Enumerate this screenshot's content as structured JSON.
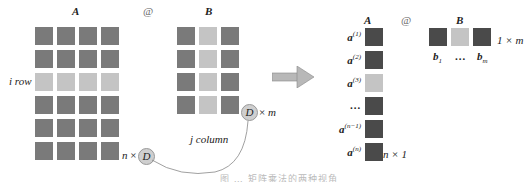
{
  "colors": {
    "dark": "#7a7a7a",
    "light": "#c4c4c4",
    "darker": "#4a4a4a",
    "circle": "#cfcfcf",
    "arrow": "#b8b8b8"
  },
  "left": {
    "matrix_a_label": "A",
    "at_symbol": "@",
    "matrix_b_label": "B",
    "row_label": "i row",
    "a_shape": {
      "n": "n",
      "times": "×",
      "d": "D"
    },
    "b_shape": {
      "d": "D",
      "times": "×",
      "m": "m"
    },
    "column_label": "j column",
    "a_grid": {
      "rows": 6,
      "cols": 4,
      "highlight_row": 2
    },
    "b_grid": {
      "rows": 4,
      "cols": 3,
      "highlight_col": 1
    }
  },
  "right": {
    "matrix_a_label": "A",
    "at_symbol": "@",
    "matrix_b_label": "B",
    "a_rows": [
      {
        "base": "a",
        "sup": "(1)",
        "highlight": false
      },
      {
        "base": "a",
        "sup": "(2)",
        "highlight": false
      },
      {
        "base": "a",
        "sup": "(3)",
        "highlight": true
      },
      {
        "base": "…",
        "sup": "",
        "highlight": false
      },
      {
        "base": "a",
        "sup": "(n−1)",
        "highlight": false
      },
      {
        "base": "a",
        "sup": "(n)",
        "highlight": false
      }
    ],
    "a_shape": "n × 1",
    "b_shape": "1 × m",
    "b_cols": [
      {
        "base": "b",
        "sub": "1",
        "highlight": false
      },
      {
        "base": "…",
        "sub": "",
        "highlight": true
      },
      {
        "base": "b",
        "sub": "m",
        "highlight": false
      }
    ]
  },
  "caption": "图 … 矩阵乘法的两种视角"
}
